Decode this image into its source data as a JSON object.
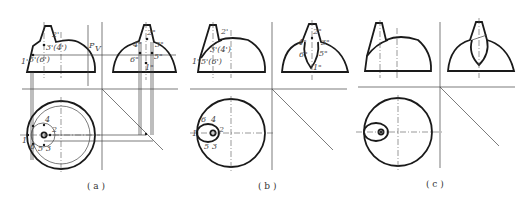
{
  "figure": {
    "panels": [
      {
        "id": "a",
        "caption": "( a )",
        "front_view_labels": [
          "2'",
          "3'(4')",
          "1'",
          "5'(6')",
          "P",
          "V"
        ],
        "side_view_labels": [
          "2\"",
          "4\"",
          "3\"",
          "6\"",
          "5\"",
          "1\""
        ],
        "top_view_labels": [
          "4",
          "1",
          "6",
          "5",
          "3",
          "2"
        ]
      },
      {
        "id": "b",
        "caption": "( b )",
        "front_view_labels": [
          "2'",
          "3'(4')",
          "1'",
          "5'(6')"
        ],
        "side_view_labels": [
          "2\"",
          "4\"",
          "3\"",
          "6\"",
          "5\"",
          "1\""
        ],
        "top_view_labels": [
          "6",
          "4",
          "1",
          "2",
          "5",
          "3"
        ]
      },
      {
        "id": "c",
        "caption": "( c )",
        "front_view_labels": [],
        "side_view_labels": [],
        "top_view_labels": []
      }
    ]
  }
}
